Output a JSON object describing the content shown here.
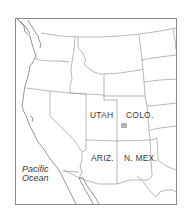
{
  "map": {
    "region": "Western United States",
    "states": [
      {
        "id": "utah",
        "label": "UTAH"
      },
      {
        "id": "colorado",
        "label": "COLO."
      },
      {
        "id": "arizona",
        "label": "ARIZ."
      },
      {
        "id": "new-mexico",
        "label": "N. MEX."
      }
    ],
    "water": {
      "ocean_line1": "Pacific",
      "ocean_line2": "Ocean"
    },
    "marker": {
      "state": "COLO.",
      "color": "#b4b4b4"
    },
    "colors": {
      "background": "#ffffff",
      "border": "#9a9a9a",
      "frame": "#8a8a8a",
      "text": "#3a3a3a"
    }
  }
}
